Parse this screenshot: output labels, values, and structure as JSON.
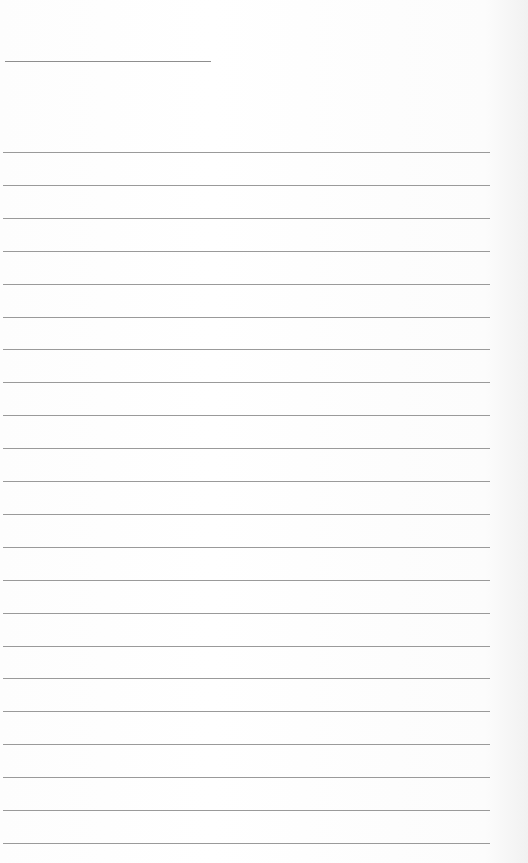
{
  "page": {
    "type": "lined-notepaper",
    "title_text": "",
    "line_color": "#9a9a9a",
    "background_color": "#ffffff",
    "ruled_line_count": 22,
    "lines": [
      "",
      "",
      "",
      "",
      "",
      "",
      "",
      "",
      "",
      "",
      "",
      "",
      "",
      "",
      "",
      "",
      "",
      "",
      "",
      "",
      "",
      ""
    ]
  }
}
